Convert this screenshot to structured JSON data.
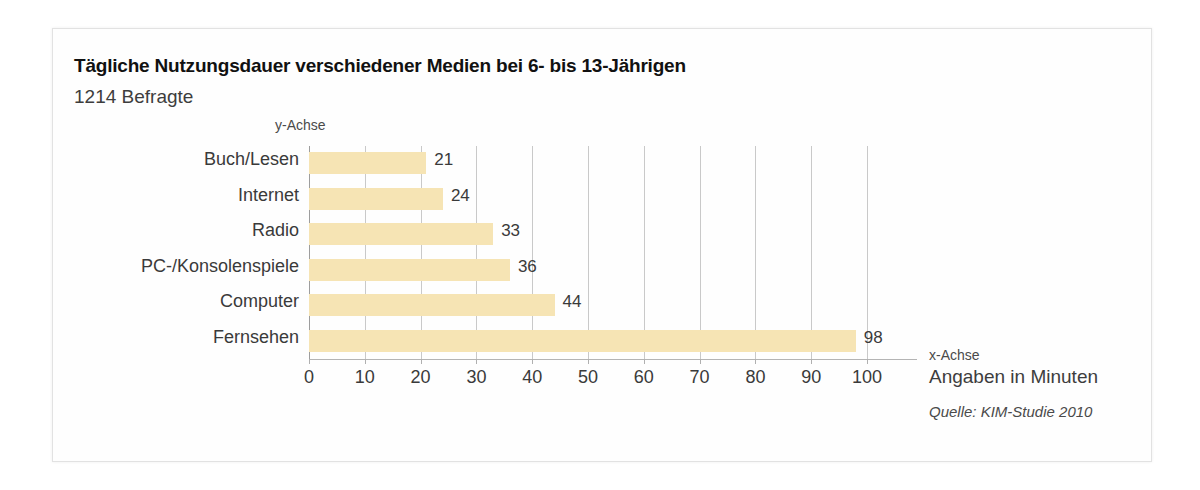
{
  "chart_data": {
    "type": "bar",
    "orientation": "horizontal",
    "title": "Tägliche Nutzungsdauer verschiedener Medien bei 6- bis 13-Jährigen",
    "subtitle": "1214 Befragte",
    "categories": [
      "Buch/Lesen",
      "Internet",
      "Radio",
      "PC-/Konsolenspiele",
      "Computer",
      "Fernsehen"
    ],
    "values": [
      21,
      24,
      33,
      36,
      44,
      98
    ],
    "value_labels": [
      "21",
      "24",
      "33",
      "36",
      "44",
      "98"
    ],
    "xlabel": "x-Achse",
    "ylabel": "y-Achse",
    "units_note": "Angaben in Minuten",
    "source": "Quelle: KIM-Studie 2010",
    "xlim": [
      0,
      100
    ],
    "xticks": [
      0,
      10,
      20,
      30,
      40,
      50,
      60,
      70,
      80,
      90,
      100
    ],
    "xtick_labels": [
      "0",
      "10",
      "20",
      "30",
      "40",
      "50",
      "60",
      "70",
      "80",
      "90",
      "100"
    ],
    "grid": true,
    "grid_axis": "x",
    "legend": false,
    "bar_color": "#f6e4b4",
    "text_color": "#3a3a3a",
    "grid_color": "#c9c9c9",
    "axis_color": "#b0b0b0",
    "background": "#fefefe"
  }
}
